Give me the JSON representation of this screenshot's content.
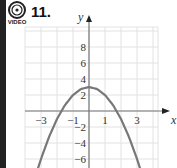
{
  "problem": {
    "number": "11.",
    "icon": "video-icon",
    "icon_label": "VIDEO"
  },
  "colors": {
    "curve": "#777777",
    "axis": "#777777",
    "grid": "#e2e2e2",
    "left_bar": "#222222"
  },
  "chart_data": {
    "type": "line",
    "title": "",
    "function": "y = 3 - x^2",
    "xlabel": "x",
    "ylabel": "y",
    "xlim": [
      -4,
      4.4
    ],
    "ylim": [
      -7,
      10.5
    ],
    "grid": true,
    "x_grid_step": 1,
    "y_grid_step": 2,
    "x_ticks": [
      {
        "value": -3,
        "label": "−3"
      },
      {
        "value": -1,
        "label": "−1"
      },
      {
        "value": 1,
        "label": "1"
      },
      {
        "value": 3,
        "label": "3"
      }
    ],
    "y_ticks": [
      {
        "value": 8,
        "label": "8"
      },
      {
        "value": 6,
        "label": "6"
      },
      {
        "value": 4,
        "label": "4"
      },
      {
        "value": 2,
        "label": "2"
      },
      {
        "value": -2,
        "label": "−2"
      },
      {
        "value": -4,
        "label": "−4"
      },
      {
        "value": -6,
        "label": "−6"
      }
    ],
    "series": [
      {
        "name": "parabola",
        "x": [
          -3.2,
          -3,
          -2.5,
          -2,
          -1.5,
          -1,
          -0.5,
          0,
          0.5,
          1,
          1.5,
          2,
          2.5,
          3,
          3.2
        ],
        "y": [
          -7.24,
          -6,
          -3.25,
          -1,
          0.75,
          2,
          2.75,
          3,
          2.75,
          2,
          0.75,
          -1,
          -3.25,
          -6,
          -7.24
        ]
      }
    ],
    "vertex": [
      0,
      3
    ]
  }
}
